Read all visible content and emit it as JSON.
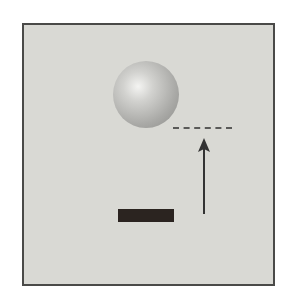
{
  "diagram": {
    "elements": {
      "panel": {
        "shape": "square",
        "fill": "#d9d9d4",
        "border": "#4a4a48"
      },
      "sphere": {
        "shape": "circle",
        "fill": "#a9a9a6",
        "highlight": "#f4f4f2"
      },
      "reference_line": {
        "style": "dashed",
        "dash_count": 6,
        "color": "#5a5a58"
      },
      "arrow": {
        "direction": "up",
        "color": "#333333"
      },
      "bar": {
        "shape": "rectangle",
        "fill": "#2b2420"
      }
    }
  }
}
